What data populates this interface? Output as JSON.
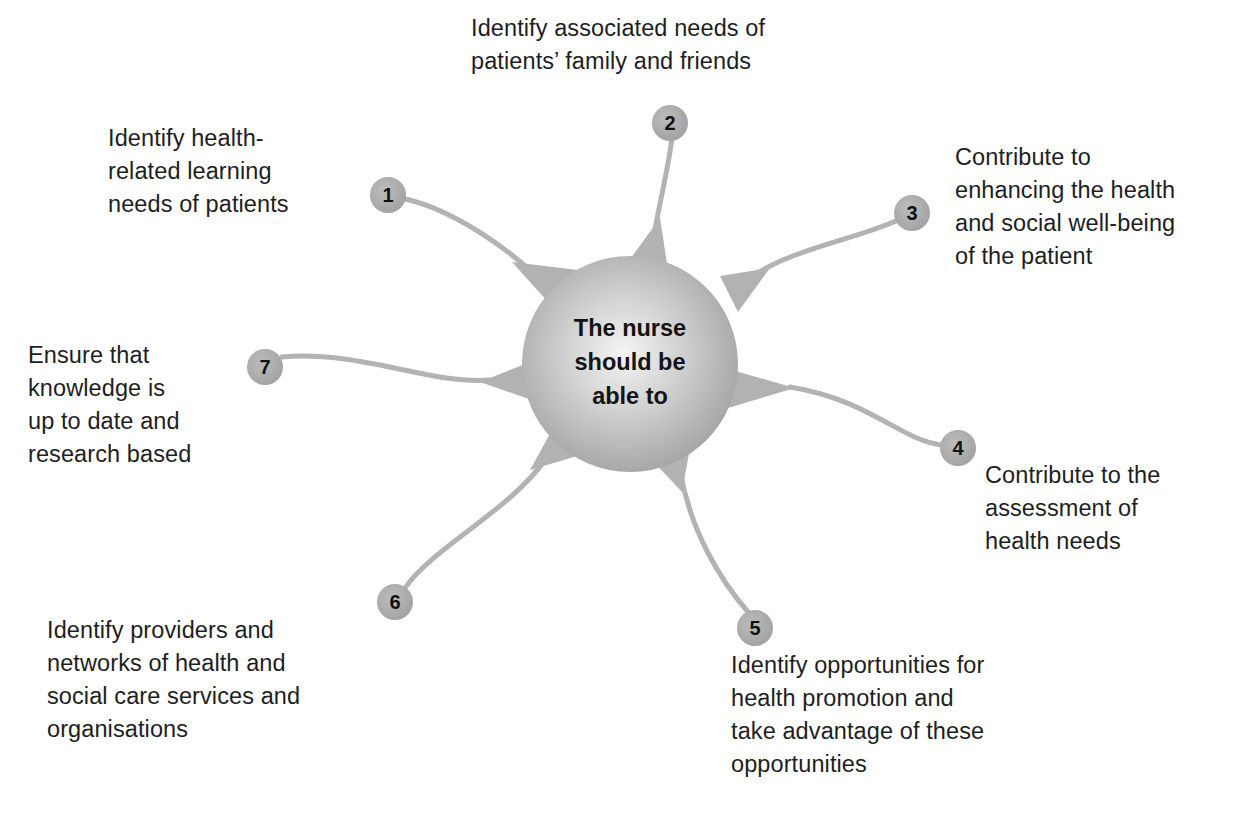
{
  "diagram": {
    "center": {
      "label": "The nurse\nshould be\nable to"
    },
    "nodes": [
      {
        "number": "1",
        "text": "Identify health-\nrelated learning\nneeds of patients"
      },
      {
        "number": "2",
        "text": "Identify associated needs of\npatients’ family and friends"
      },
      {
        "number": "3",
        "text": "Contribute to\nenhancing the health\nand social well-being\nof the patient"
      },
      {
        "number": "4",
        "text": "Contribute to the\nassessment of\nhealth needs"
      },
      {
        "number": "5",
        "text": "Identify opportunities for\nhealth promotion and\ntake advantage of these\nopportunities"
      },
      {
        "number": "6",
        "text": "Identify providers and\nnetworks of health and\nsocial care services and\norganisations"
      },
      {
        "number": "7",
        "text": "Ensure that\nknowledge is\nup to date and\nresearch based"
      }
    ]
  },
  "colors": {
    "sphere_light": "#f2f2f2",
    "sphere_mid": "#c4c4c4",
    "sphere_dark": "#9e9e9e",
    "connector": "#b3b3b3",
    "node_fill": "#a9a9a9",
    "text": "#1e1e1e"
  }
}
